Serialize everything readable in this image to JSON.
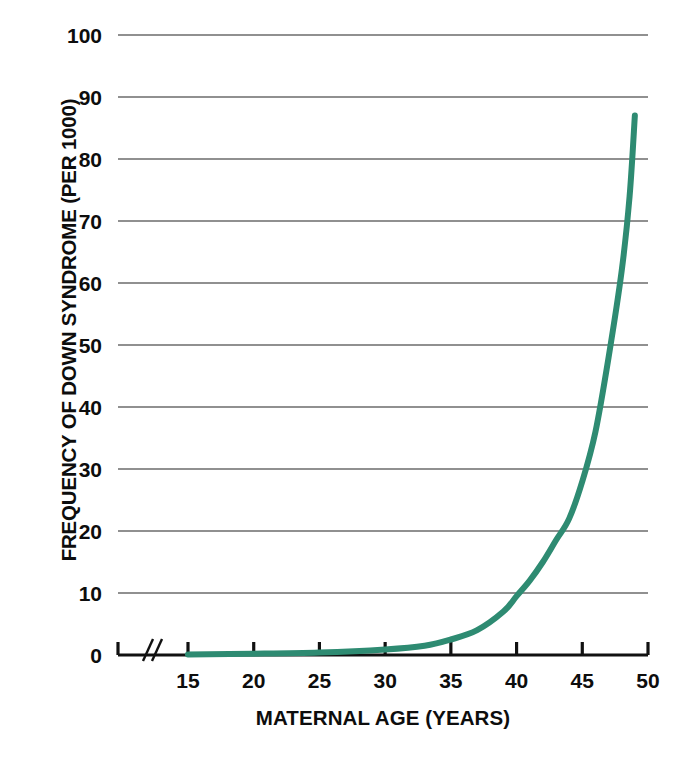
{
  "chart_data": {
    "type": "line",
    "title": "",
    "xlabel": "MATERNAL AGE (YEARS)",
    "ylabel": "FREQUENCY OF DOWN SYNDROME (PER 1000)",
    "xlim": [
      15,
      50
    ],
    "ylim": [
      0,
      100
    ],
    "xticks": [
      15,
      20,
      25,
      30,
      35,
      40,
      45,
      50
    ],
    "xtick_labels": [
      "15",
      "20",
      "25",
      "30",
      "35",
      "40",
      "45",
      "50"
    ],
    "yticks": [
      0,
      10,
      20,
      30,
      40,
      50,
      60,
      70,
      80,
      90,
      100
    ],
    "ytick_labels": [
      "0",
      "10",
      "20",
      "30",
      "40",
      "50",
      "60",
      "70",
      "80",
      "90",
      "100"
    ],
    "grid": true,
    "grid_axis": "y",
    "axis_break": true,
    "axis_break_label": "//",
    "legend": false,
    "series": [
      {
        "name": "Frequency of Down syndrome",
        "color": "#2E8B72",
        "line_width": 6,
        "x": [
          15,
          20,
          25,
          30,
          33,
          35,
          37,
          39,
          40,
          41,
          42,
          43,
          44,
          45,
          46,
          47,
          48,
          48.6,
          49
        ],
        "values": [
          0.1,
          0.2,
          0.4,
          0.9,
          1.5,
          2.5,
          4.0,
          7.0,
          9.5,
          12.0,
          15.0,
          18.5,
          22.0,
          28.0,
          36.0,
          48.0,
          62.0,
          74.0,
          87.0
        ]
      }
    ],
    "colors": {
      "curve": "#2E8B72",
      "axis": "#111111",
      "gridline": "#6b6b6b",
      "text": "#0d0d0d",
      "background": "#ffffff"
    }
  }
}
